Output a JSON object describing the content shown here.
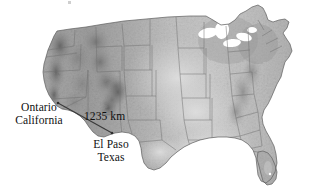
{
  "figure": {
    "kind": "shaded-relief-map",
    "region": "Contiguous United States",
    "background_color": "#ffffff",
    "land_base_color": "#b4b4b4",
    "border_color": "#6b6b6b",
    "outline_color": "#5a5a5a",
    "label_color": "#101010"
  },
  "annotations": {
    "origin": {
      "city": "Ontario",
      "state": "California"
    },
    "destination": {
      "city": "El Paso",
      "state": "Texas"
    },
    "distance": {
      "value": "1235",
      "unit": "km",
      "text": "1235 km"
    }
  },
  "measurement_line": {
    "from_x": 58,
    "from_y": 103,
    "to_x": 112,
    "to_y": 133,
    "color": "#3d3d3d"
  }
}
